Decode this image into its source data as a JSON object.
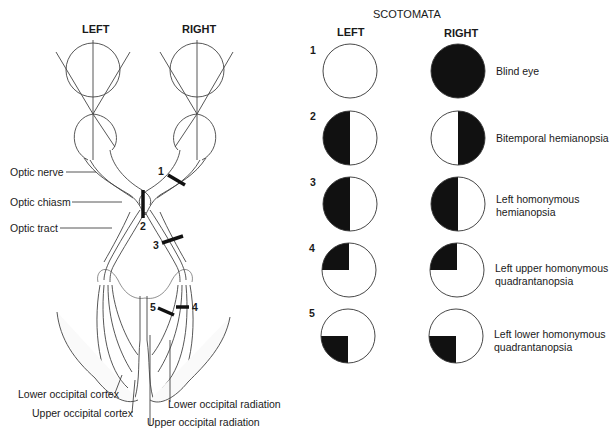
{
  "anatomy": {
    "eye_left_label": "LEFT",
    "eye_right_label": "RIGHT",
    "structures": {
      "optic_nerve": "Optic nerve",
      "optic_chiasm": "Optic chiasm",
      "optic_tract": "Optic tract",
      "lower_occipital_cortex": "Lower occipital cortex",
      "upper_occipital_cortex": "Upper occipital cortex",
      "lower_occipital_radiation": "Lower occipital radiation",
      "upper_occipital_radiation": "Upper occipital radiation"
    },
    "lesion_markers": [
      "1",
      "2",
      "3",
      "4",
      "5"
    ]
  },
  "scotomata": {
    "title": "SCOTOMATA",
    "col_left": "LEFT",
    "col_right": "RIGHT",
    "rows": [
      {
        "num": "1",
        "left": "none",
        "right": "full",
        "label": [
          "Blind eye"
        ]
      },
      {
        "num": "2",
        "left": "left-half",
        "right": "right-half",
        "label": [
          "Bitemporal hemianopsia"
        ]
      },
      {
        "num": "3",
        "left": "left-half",
        "right": "left-half",
        "label": [
          "Left homonymous",
          "hemianopsia"
        ]
      },
      {
        "num": "4",
        "left": "upper-left-quadrant",
        "right": "upper-left-quadrant",
        "label": [
          "Left upper homonymous",
          "quadrantanopsia"
        ]
      },
      {
        "num": "5",
        "left": "lower-left-quadrant",
        "right": "lower-left-quadrant",
        "label": [
          "Left lower homonymous",
          "quadrantanopsia"
        ]
      }
    ]
  },
  "colors": {
    "ink": "#1a1a1a",
    "line": "#444444",
    "shade": "#f2f2f2"
  }
}
